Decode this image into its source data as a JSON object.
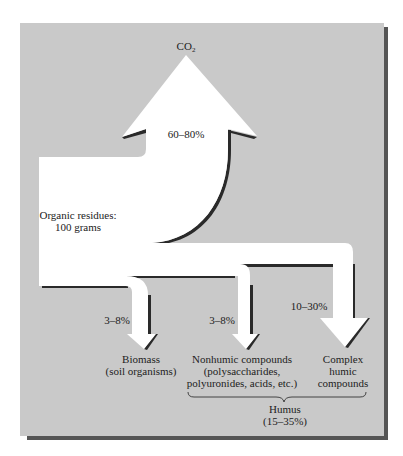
{
  "diagram": {
    "type": "flow",
    "colors": {
      "panel": "#c9c9c9",
      "panel_shadow": "#555555",
      "arrow_fill": "#ffffff",
      "arrow_edge": "#2a2a2a",
      "text": "#222222"
    },
    "output_top": {
      "label": "CO",
      "subscript": "2"
    },
    "main_arrow": {
      "percent": "60–80%"
    },
    "source": {
      "line1": "Organic residues:",
      "line2": "100 grams"
    },
    "branches": [
      {
        "percent": "3–8%",
        "lines": [
          "Biomass",
          "(soil organisms)"
        ]
      },
      {
        "percent": "3–8%",
        "lines": [
          "Nonhumic compounds",
          "(polysaccharides,",
          "polyuronides, acids, etc.)"
        ]
      },
      {
        "percent": "10–30%",
        "lines": [
          "Complex",
          "humic",
          "compounds"
        ]
      }
    ],
    "group": {
      "label": "Humus",
      "percent": "(15–35%)"
    }
  }
}
